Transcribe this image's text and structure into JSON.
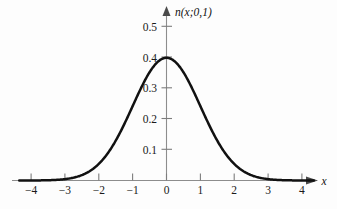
{
  "chart_data": {
    "type": "line",
    "title": "",
    "subtitle": "",
    "xlabel": "x",
    "ylabel": "n(x;0,1)",
    "xlim": [
      -4.35,
      4.35
    ],
    "ylim": [
      0,
      0.56
    ],
    "grid": false,
    "legend": null,
    "x_ticks": [
      -4,
      -3,
      -2,
      -1,
      0,
      1,
      2,
      3,
      4
    ],
    "x_tick_labels": [
      "−4",
      "−3",
      "−2",
      "−1",
      "0",
      "1",
      "2",
      "3",
      "4"
    ],
    "y_ticks": [
      0.1,
      0.2,
      0.3,
      0.4,
      0.5
    ],
    "y_tick_labels": [
      "0.1",
      "0.2",
      "0.3",
      "0.4",
      "0.5"
    ],
    "series": [
      {
        "name": "n(x;0,1)",
        "function": "standard normal density",
        "color": "#111111",
        "x": [
          -4.3,
          -4.1,
          -3.9,
          -3.7,
          -3.5,
          -3.3,
          -3.1,
          -2.9,
          -2.7,
          -2.5,
          -2.3,
          -2.1,
          -1.9,
          -1.7,
          -1.5,
          -1.3,
          -1.1,
          -0.9,
          -0.7,
          -0.5,
          -0.3,
          -0.1,
          0.1,
          0.3,
          0.5,
          0.7,
          0.9,
          1.1,
          1.3,
          1.5,
          1.7,
          1.9,
          2.1,
          2.3,
          2.5,
          2.7,
          2.9,
          3.1,
          3.3,
          3.5,
          3.7,
          3.9,
          4.1,
          4.3
        ],
        "y": [
          0.0,
          0.0001,
          0.0002,
          0.0004,
          0.0009,
          0.0017,
          0.0033,
          0.006,
          0.0104,
          0.0175,
          0.0283,
          0.044,
          0.0656,
          0.094,
          0.1295,
          0.1714,
          0.2179,
          0.2661,
          0.3123,
          0.3521,
          0.3814,
          0.397,
          0.397,
          0.3814,
          0.3521,
          0.3123,
          0.2661,
          0.2179,
          0.1714,
          0.1295,
          0.094,
          0.0656,
          0.044,
          0.0283,
          0.0175,
          0.0104,
          0.006,
          0.0033,
          0.0017,
          0.0009,
          0.0004,
          0.0002,
          0.0001,
          0.0
        ]
      }
    ],
    "annotations": [
      {
        "text": "peak value",
        "x": 0,
        "y": 0.3989
      }
    ]
  },
  "axes": {
    "x_axis_label": "x",
    "y_axis_label": "n(x;0,1)",
    "x_axis_arrow": "right-arrow-icon",
    "y_axis_arrow": "up-arrow-icon"
  },
  "colors": {
    "curve": "#111111",
    "axis": "#8d8d8d",
    "tick": "#7d7d7d",
    "text": "#111111",
    "background": "#fdfdfd"
  }
}
